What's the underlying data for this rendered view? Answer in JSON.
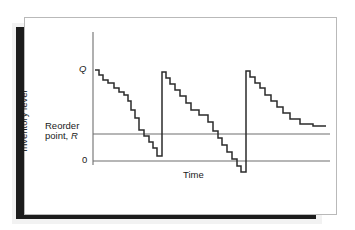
{
  "figure": {
    "kind": "inventory-sawtooth-diagram",
    "caption_labels": {
      "y_axis_title": "Inventory level",
      "x_axis_title": "Time",
      "order_quantity": "Q",
      "reorder_line_1": "Reorder",
      "reorder_line_2": "point, ",
      "reorder_symbol": "R",
      "zero": "0"
    },
    "colors": {
      "card_background": "#ffffff",
      "card_border": "#b9b9b9",
      "shadow": "#1c1c1c",
      "shadow_soft": "#f2f2f2",
      "curve": "#2b2b2b",
      "axis": "#6f6f6f",
      "reference_line": "#6f6f6f",
      "text": "#1a1a1a"
    }
  },
  "chart_data": {
    "type": "line",
    "title": "",
    "xlabel": "Time",
    "ylabel": "Inventory level",
    "grid": false,
    "legend": null,
    "xlim": [
      93,
      330
    ],
    "ylim_pixels": [
      172,
      70
    ],
    "y_reference_levels": [
      {
        "name": "Q",
        "label": "Q",
        "pixel_y": 70
      },
      {
        "name": "reorder_point",
        "label": "Reorder point, R",
        "pixel_y": 134
      },
      {
        "name": "zero",
        "label": "0",
        "pixel_y": 161
      }
    ],
    "axes": {
      "y_axis_x": 93,
      "y_axis_top": 32,
      "y_axis_bottom": 165,
      "reorder_line_x_start": 93,
      "reorder_line_x_end": 330,
      "zero_line_x_start": 93,
      "zero_line_x_end": 330
    },
    "series": [
      {
        "name": "inventory_level",
        "note": "staircase polyline, pixel coordinates (x,y)",
        "points": [
          [
            95,
            70
          ],
          [
            99,
            70
          ],
          [
            99,
            75
          ],
          [
            103,
            75
          ],
          [
            103,
            80
          ],
          [
            108,
            80
          ],
          [
            108,
            83
          ],
          [
            114,
            83
          ],
          [
            114,
            88
          ],
          [
            119,
            88
          ],
          [
            119,
            92
          ],
          [
            124,
            92
          ],
          [
            124,
            95
          ],
          [
            128,
            95
          ],
          [
            128,
            101
          ],
          [
            131,
            101
          ],
          [
            131,
            110
          ],
          [
            135,
            110
          ],
          [
            135,
            118
          ],
          [
            139,
            118
          ],
          [
            139,
            130
          ],
          [
            144,
            130
          ],
          [
            144,
            136
          ],
          [
            149,
            136
          ],
          [
            149,
            142
          ],
          [
            153,
            142
          ],
          [
            153,
            148
          ],
          [
            157,
            148
          ],
          [
            157,
            156
          ],
          [
            162,
            156
          ],
          [
            162,
            72
          ],
          [
            166,
            72
          ],
          [
            166,
            78
          ],
          [
            170,
            78
          ],
          [
            170,
            84
          ],
          [
            175,
            84
          ],
          [
            175,
            90
          ],
          [
            180,
            90
          ],
          [
            180,
            96
          ],
          [
            186,
            96
          ],
          [
            186,
            103
          ],
          [
            191,
            103
          ],
          [
            191,
            110
          ],
          [
            199,
            110
          ],
          [
            199,
            115
          ],
          [
            208,
            115
          ],
          [
            208,
            122
          ],
          [
            213,
            122
          ],
          [
            213,
            131
          ],
          [
            218,
            131
          ],
          [
            218,
            138
          ],
          [
            222,
            138
          ],
          [
            222,
            145
          ],
          [
            227,
            145
          ],
          [
            227,
            152
          ],
          [
            232,
            152
          ],
          [
            232,
            159
          ],
          [
            237,
            159
          ],
          [
            237,
            166
          ],
          [
            241,
            166
          ],
          [
            241,
            172
          ],
          [
            246,
            172
          ],
          [
            246,
            71
          ],
          [
            250,
            71
          ],
          [
            250,
            77
          ],
          [
            255,
            77
          ],
          [
            255,
            83
          ],
          [
            260,
            83
          ],
          [
            260,
            88
          ],
          [
            265,
            88
          ],
          [
            265,
            95
          ],
          [
            271,
            95
          ],
          [
            271,
            101
          ],
          [
            277,
            101
          ],
          [
            277,
            107
          ],
          [
            283,
            107
          ],
          [
            283,
            113
          ],
          [
            290,
            113
          ],
          [
            290,
            119
          ],
          [
            300,
            119
          ],
          [
            300,
            124
          ],
          [
            313,
            124
          ],
          [
            313,
            126
          ],
          [
            326,
            126
          ]
        ]
      }
    ],
    "cycles": [
      {
        "index": 1,
        "replenishment_x": 162,
        "stockout": false,
        "trough_pixel_y": 156
      },
      {
        "index": 2,
        "replenishment_x": 246,
        "stockout": true,
        "trough_pixel_y": 172
      },
      {
        "index": 3,
        "replenishment_x": null,
        "stockout": false,
        "trough_pixel_y": 126
      }
    ]
  }
}
